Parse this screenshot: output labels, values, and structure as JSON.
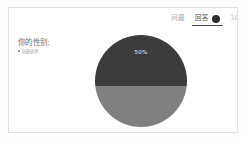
{
  "card": {
    "tabs": [
      {
        "label": "问题",
        "active": false,
        "badge": null,
        "clipped": false
      },
      {
        "label": "回答",
        "active": true,
        "badge": "dot-badge",
        "clipped": false
      },
      {
        "label": "30",
        "active": false,
        "badge": null,
        "clipped": true
      }
    ],
    "content": {
      "question_title": "你的性别:",
      "answer_line": "创建表单"
    }
  },
  "chart_data": {
    "type": "pie",
    "title": "你的性别:",
    "categories": [
      "男",
      "女"
    ],
    "values": [
      50,
      50
    ],
    "labels": [
      "50%",
      ""
    ],
    "visible_label": "50%",
    "colors": [
      "#3c3c3c",
      "#808080"
    ],
    "legend": "none",
    "grid": false
  },
  "theme": {
    "card_bg": "#ffffff",
    "page_bg": "#fdfdfd",
    "border": "#e2e2e2",
    "accent": "#3c3c3c",
    "muted_text": "#9a9a9a",
    "active_text": "#4a4a4a"
  }
}
